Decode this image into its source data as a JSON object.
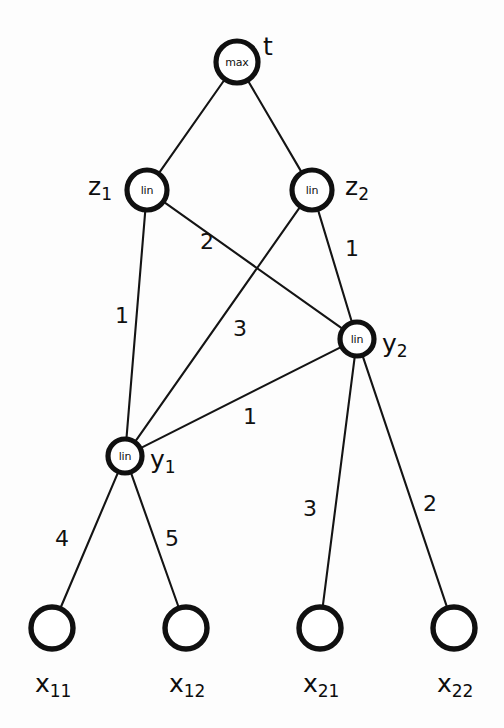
{
  "figure": {
    "background_color": "#fdfdfd",
    "stroke_color": "#111111"
  },
  "nodes": {
    "t": {
      "id": "t",
      "inner_label": "max",
      "name": "t",
      "subscript": "",
      "cx": 237,
      "cy": 62,
      "r": 21,
      "label_x": 263,
      "label_y": 48,
      "type": "max"
    },
    "z1": {
      "id": "z1",
      "inner_label": "lin",
      "name": "z",
      "subscript": "1",
      "cx": 147,
      "cy": 190,
      "r": 20,
      "label_x": 88,
      "label_y": 188,
      "type": "lin"
    },
    "z2": {
      "id": "z2",
      "inner_label": "lin",
      "name": "z",
      "subscript": "2",
      "cx": 312,
      "cy": 190,
      "r": 20,
      "label_x": 345,
      "label_y": 188,
      "type": "lin"
    },
    "y1": {
      "id": "y1",
      "inner_label": "lin",
      "name": "y",
      "subscript": "1",
      "cx": 125,
      "cy": 456,
      "r": 17,
      "label_x": 150,
      "label_y": 461,
      "type": "lin"
    },
    "y2": {
      "id": "y2",
      "inner_label": "lin",
      "name": "y",
      "subscript": "2",
      "cx": 357,
      "cy": 339,
      "r": 17,
      "label_x": 382,
      "label_y": 345,
      "type": "lin"
    },
    "x11": {
      "id": "x11",
      "inner_label": "",
      "name": "x",
      "subscript": "11",
      "cx": 52,
      "cy": 628,
      "r": 21,
      "label_x": 35,
      "label_y": 685,
      "type": "input"
    },
    "x12": {
      "id": "x12",
      "inner_label": "",
      "name": "x",
      "subscript": "12",
      "cx": 186,
      "cy": 628,
      "r": 21,
      "label_x": 169,
      "label_y": 685,
      "type": "input"
    },
    "x21": {
      "id": "x21",
      "inner_label": "",
      "name": "x",
      "subscript": "21",
      "cx": 320,
      "cy": 628,
      "r": 21,
      "label_x": 303,
      "label_y": 685,
      "type": "input"
    },
    "x22": {
      "id": "x22",
      "inner_label": "",
      "name": "x",
      "subscript": "22",
      "cx": 454,
      "cy": 628,
      "r": 21,
      "label_x": 437,
      "label_y": 685,
      "type": "input"
    }
  },
  "edges": [
    {
      "from": "t",
      "to": "z1",
      "weight": "",
      "wx": 0,
      "wy": 0
    },
    {
      "from": "t",
      "to": "z2",
      "weight": "",
      "wx": 0,
      "wy": 0
    },
    {
      "from": "z1",
      "to": "y1",
      "weight": "1",
      "wx": 122,
      "wy": 317
    },
    {
      "from": "z1",
      "to": "y2",
      "weight": "2",
      "wx": 207,
      "wy": 243
    },
    {
      "from": "z2",
      "to": "y1",
      "weight": "3",
      "wx": 240,
      "wy": 330
    },
    {
      "from": "z2",
      "to": "y2",
      "weight": "1",
      "wx": 352,
      "wy": 250
    },
    {
      "from": "y2",
      "to": "y1",
      "weight": "1",
      "wx": 250,
      "wy": 418
    },
    {
      "from": "y1",
      "to": "x11",
      "weight": "4",
      "wx": 62,
      "wy": 540
    },
    {
      "from": "y1",
      "to": "x12",
      "weight": "5",
      "wx": 172,
      "wy": 540
    },
    {
      "from": "y2",
      "to": "x21",
      "weight": "3",
      "wx": 310,
      "wy": 510
    },
    {
      "from": "y2",
      "to": "x22",
      "weight": "2",
      "wx": 430,
      "wy": 505
    }
  ]
}
